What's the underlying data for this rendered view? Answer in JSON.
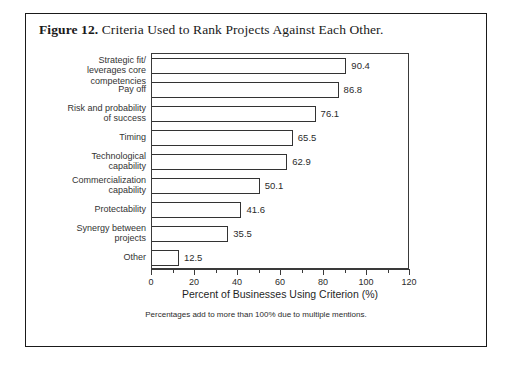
{
  "figure": {
    "number_label": "Figure 12.",
    "caption": "Criteria Used to Rank Projects Against Each Other.",
    "footnote": "Percentages add to more than 100% due to multiple mentions."
  },
  "chart_data": {
    "type": "bar",
    "orientation": "horizontal",
    "title": "Criteria Used to Rank Projects Against Each Other.",
    "categories": [
      "Strategic fit/\nleverages core competencies",
      "Pay off",
      "Risk and probability\nof success",
      "Timing",
      "Technological\ncapability",
      "Commercialization\ncapability",
      "Protectability",
      "Synergy between\nprojects",
      "Other"
    ],
    "category_lines": [
      [
        "Strategic fit/",
        "leverages core competencies"
      ],
      [
        "Pay off"
      ],
      [
        "Risk and probability",
        "of success"
      ],
      [
        "Timing"
      ],
      [
        "Technological",
        "capability"
      ],
      [
        "Commercialization",
        "capability"
      ],
      [
        "Protectability"
      ],
      [
        "Synergy between",
        "projects"
      ],
      [
        "Other"
      ]
    ],
    "values": [
      90.4,
      86.8,
      76.1,
      65.5,
      62.9,
      50.1,
      41.6,
      35.5,
      12.5
    ],
    "value_labels": [
      "90.4",
      "86.8",
      "76.1",
      "65.5",
      "62.9",
      "50.1",
      "41.6",
      "35.5",
      "12.5"
    ],
    "xlabel": "Percent of Businesses Using Criterion (%)",
    "ylabel": "",
    "xlim": [
      0,
      120
    ],
    "xticks": [
      0,
      20,
      40,
      60,
      80,
      100,
      120
    ],
    "xtick_labels": [
      "0",
      "20",
      "40",
      "60",
      "80",
      "100",
      "120"
    ],
    "minor_tick_interval": 10,
    "grid": false,
    "legend": null,
    "bar_fill_color": "#ffffff",
    "bar_edge_color": "#333333"
  }
}
